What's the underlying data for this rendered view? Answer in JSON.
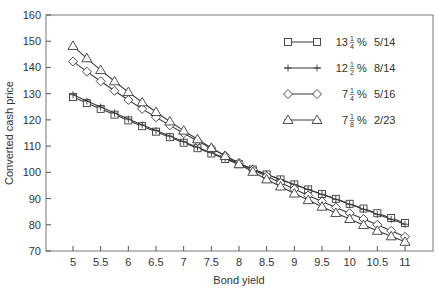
{
  "chart_data": {
    "type": "line",
    "title": "",
    "xlabel": "Bond yield",
    "ylabel": "Converted cash price",
    "xlim": [
      4.5,
      11.5
    ],
    "ylim": [
      70,
      160
    ],
    "xticks": [
      5,
      5.5,
      6,
      6.5,
      7,
      7.5,
      8,
      8.5,
      9,
      9.5,
      10,
      10.5,
      11
    ],
    "xtick_labels": [
      "5",
      "5.5",
      "6",
      "6.5",
      "7",
      "7.5",
      "8",
      "8.5",
      "9",
      "9.5",
      "10",
      "10.5",
      "11"
    ],
    "yticks": [
      70,
      80,
      90,
      100,
      110,
      120,
      130,
      140,
      150,
      160
    ],
    "ytick_labels": [
      "70",
      "80",
      "90",
      "100",
      "110",
      "120",
      "130",
      "140",
      "150",
      "160"
    ],
    "grid": false,
    "legend_position": "upper right",
    "x": [
      5,
      5.25,
      5.5,
      5.75,
      6,
      6.25,
      6.5,
      6.75,
      7,
      7.25,
      7.5,
      7.75,
      8,
      8.25,
      8.5,
      8.75,
      9,
      9.25,
      9.5,
      9.75,
      10,
      10.25,
      10.5,
      10.75,
      11
    ],
    "series": [
      {
        "name": "13 1/4% 5/14",
        "coupon_whole": "13",
        "coupon_num": "1",
        "coupon_den": "4",
        "maturity": "5/14",
        "marker": "square",
        "values": [
          128.7,
          126.4,
          124.2,
          122.0,
          119.8,
          117.6,
          115.5,
          113.4,
          111.3,
          109.2,
          107.2,
          105.1,
          103.1,
          101.1,
          99.2,
          97.3,
          95.4,
          93.5,
          91.7,
          89.9,
          88.0,
          86.2,
          84.4,
          82.6,
          80.7
        ]
      },
      {
        "name": "12 1/2% 8/14",
        "coupon_whole": "12",
        "coupon_num": "1",
        "coupon_den": "2",
        "maturity": "8/14",
        "marker": "plus",
        "values": [
          129.6,
          127.2,
          124.9,
          122.6,
          120.3,
          118.1,
          116.0,
          113.8,
          111.7,
          109.6,
          107.5,
          105.4,
          103.3,
          101.3,
          99.3,
          97.3,
          95.4,
          93.5,
          91.6,
          89.7,
          87.8,
          85.9,
          84.0,
          82.1,
          80.2
        ]
      },
      {
        "name": "7 1/4% 5/16",
        "coupon_whole": "7",
        "coupon_num": "1",
        "coupon_den": "4",
        "maturity": "5/16",
        "marker": "diamond",
        "values": [
          142.3,
          138.4,
          134.7,
          131.1,
          127.6,
          124.2,
          121.0,
          117.9,
          114.9,
          112.0,
          109.2,
          106.4,
          103.6,
          101.0,
          98.5,
          96.0,
          93.6,
          91.2,
          88.9,
          86.6,
          84.4,
          82.2,
          80.0,
          77.7,
          75.4
        ]
      },
      {
        "name": "7 1/8% 2/23",
        "coupon_whole": "7",
        "coupon_num": "1",
        "coupon_den": "8",
        "maturity": "2/23",
        "marker": "triangle",
        "values": [
          148.2,
          143.5,
          139.0,
          134.7,
          130.6,
          126.7,
          123.0,
          119.4,
          115.9,
          112.6,
          109.3,
          106.2,
          103.1,
          100.2,
          97.3,
          94.6,
          91.9,
          89.4,
          86.9,
          84.5,
          82.2,
          79.9,
          77.7,
          75.6,
          73.5
        ]
      }
    ]
  },
  "style": {
    "line_color": "#3a3a3a",
    "marker_fill": "#ffffff",
    "axis_color": "#555555",
    "text_color": "#333333"
  }
}
